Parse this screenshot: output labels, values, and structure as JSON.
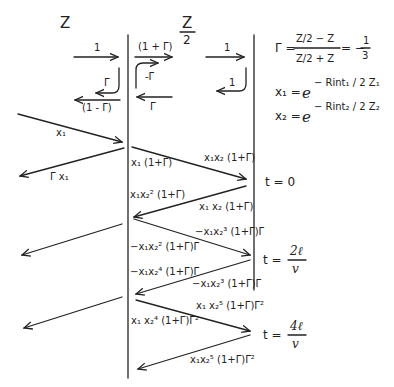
{
  "regions": {
    "left_impedance": "Z",
    "middle_impedance_num": "Z",
    "middle_impedance_den": "2"
  },
  "interface_coefficients": {
    "left_incident": "1",
    "left_reflected": "Γ",
    "left_transmitted_back": "(1 - Γ)",
    "mid_transmitted": "(1 + Γ)",
    "mid_reflected": "-Γ",
    "mid_back": "Γ",
    "right_incident": "1",
    "right_reflected": "1"
  },
  "equations": {
    "gamma_lhs": "Γ =",
    "gamma_num": "Z/2 − Z",
    "gamma_den": "Z/2 + Z",
    "gamma_value": "= − 1/3",
    "gamma_value_prefix": "= −",
    "gamma_value_num": "1",
    "gamma_value_den": "3",
    "x1_lhs": "x₁ =",
    "x1_base": "e",
    "x1_exp": "− Rint₁ / 2 Z₁",
    "x2_lhs": "x₂ =",
    "x2_base": "e",
    "x2_exp": "− Rint₂ / 2 Z₂"
  },
  "waves": [
    {
      "id": "w1",
      "label": "x₁"
    },
    {
      "id": "w2",
      "label": "Γ x₁"
    },
    {
      "id": "w3",
      "label": "x₁ (1+Γ)"
    },
    {
      "id": "w4",
      "label": "x₁x₂ (1+Γ)"
    },
    {
      "id": "w5",
      "label": "x₁x₂² (1+Γ)"
    },
    {
      "id": "w6",
      "label": "x₁ x₂ (1+Γ)"
    },
    {
      "id": "w7",
      "label": "−x₁x₂³ (1+Γ)Γ"
    },
    {
      "id": "w8",
      "label": "−x₁x₂² (1+Γ)Γ"
    },
    {
      "id": "w9",
      "label": "−x₁x₂⁴ (1+Γ)Γ"
    },
    {
      "id": "w10",
      "label": "−x₁x₂³ (1+Γ)Γ"
    },
    {
      "id": "w11",
      "label": "x₁ x₂⁵ (1+Γ)Γ²"
    },
    {
      "id": "w12",
      "label": "x₁ x₂⁴ (1+Γ)Γ²"
    },
    {
      "id": "w13",
      "label": "x₁x₂⁵ (1+Γ)Γ²"
    }
  ],
  "time_markers": [
    {
      "label": "t = 0"
    },
    {
      "prefix": "t =",
      "num": "2ℓ",
      "den": "v"
    },
    {
      "prefix": "t =",
      "num": "4ℓ",
      "den": "v"
    }
  ]
}
